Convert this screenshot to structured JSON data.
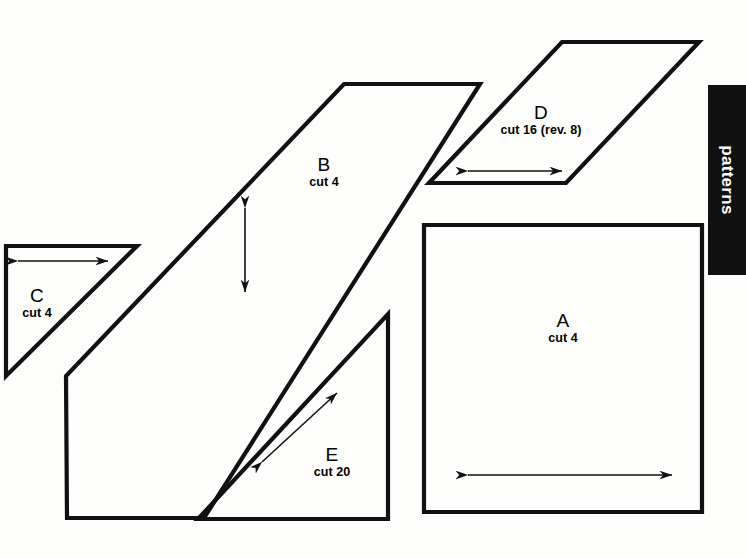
{
  "page": {
    "background_color": "#fdfdfc",
    "ink_color": "#111111",
    "width": 746,
    "height": 558
  },
  "section_tab": {
    "label": "patterns",
    "background_color": "#111111",
    "text_color": "#ffffff"
  },
  "pieces": [
    {
      "id": "A",
      "letter": "A",
      "cut": "cut 4",
      "shape": "rectangle",
      "label_x": 563,
      "label_y": 312,
      "points": "424,225 702,225 702,512 424,512",
      "grain": {
        "type": "double-arrow-horizontal",
        "x1": 468,
        "y1": 475,
        "x2": 672,
        "y2": 475
      }
    },
    {
      "id": "B",
      "letter": "B",
      "cut": "cut 4",
      "shape": "parallelogram",
      "label_x": 324,
      "label_y": 156,
      "points": "344,84 480,84 204,518 67,518 66,376",
      "grain": {
        "type": "double-arrow-vertical",
        "x1": 245,
        "y1": 208,
        "x2": 245,
        "y2": 292
      }
    },
    {
      "id": "C",
      "letter": "C",
      "cut": "cut 4",
      "shape": "right-triangle",
      "label_x": 37,
      "label_y": 287,
      "points": "6,246 137,246 6,376",
      "grain": {
        "type": "double-arrow-horizontal",
        "x1": 18,
        "y1": 261,
        "x2": 108,
        "y2": 261
      }
    },
    {
      "id": "D",
      "letter": "D",
      "cut": "cut 16 (rev. 8)",
      "shape": "parallelogram",
      "label_x": 541,
      "label_y": 104,
      "points": "562,42 699,42 566,183 429,183",
      "grain": {
        "type": "double-arrow-horizontal",
        "x1": 468,
        "y1": 171,
        "x2": 562,
        "y2": 171
      }
    },
    {
      "id": "E",
      "letter": "E",
      "cut": "cut 20",
      "shape": "right-triangle",
      "label_x": 332,
      "label_y": 446,
      "points": "388,314 388,519 198,519",
      "grain": {
        "type": "double-arrow-diagonal",
        "x1": 262,
        "y1": 462,
        "x2": 337,
        "y2": 393
      }
    }
  ]
}
